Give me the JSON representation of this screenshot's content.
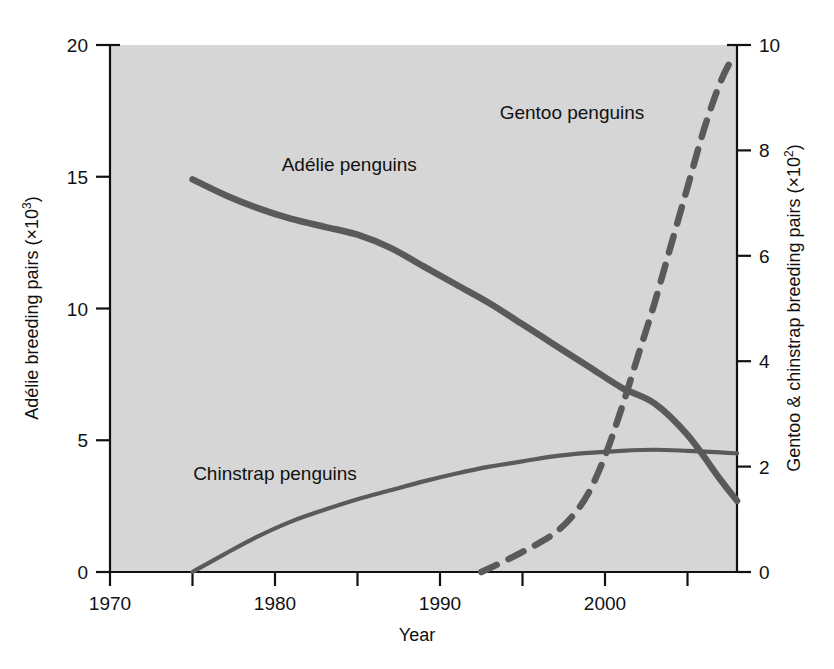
{
  "figure": {
    "background_color": "#ffffff",
    "plot_background_color": "#d6d6d6",
    "line_color": "#5a5a5a",
    "axis_color": "#111111"
  },
  "chart_data": {
    "type": "line",
    "title": "",
    "subtitle": "",
    "xlabel": "Year",
    "ylabel": "Adélie breeding pairs (×10³)",
    "y2label": "Gentoo & chinstrap breeding pairs (×10²)",
    "xlim": [
      1970,
      2008
    ],
    "ylim": [
      0,
      20
    ],
    "y2lim": [
      0,
      10
    ],
    "grid": false,
    "legend_position": "inline-annotations",
    "xticks": [
      1970,
      1975,
      1980,
      1985,
      1990,
      1995,
      2000,
      2005
    ],
    "xtick_labels": [
      "1970",
      "",
      "1980",
      "",
      "1990",
      "",
      "2000",
      ""
    ],
    "xtick_labels_shown": [
      "1970",
      "1980",
      "1990",
      "2000"
    ],
    "yticks": [
      0,
      5,
      10,
      15,
      20
    ],
    "ytick_labels": [
      "0",
      "5",
      "10",
      "15",
      "20"
    ],
    "y2ticks": [
      0,
      2,
      4,
      6,
      8,
      10
    ],
    "y2tick_labels": [
      "0",
      "2",
      "4",
      "6",
      "8",
      "10"
    ],
    "annotations": [
      {
        "text": "Adélie penguins",
        "x": 1984.5,
        "y": 15.2,
        "axis": "left"
      },
      {
        "text": "Gentoo penguins",
        "x": 1998.0,
        "y": 8.6,
        "axis": "right"
      },
      {
        "text": "Chinstrap penguins",
        "x": 1980.0,
        "y": 1.75,
        "axis": "right"
      }
    ],
    "series": [
      {
        "name": "Adélie penguins",
        "axis": "left",
        "style": "solid",
        "units": "breeding pairs (×10³)",
        "x": [
          1975,
          1977,
          1979,
          1981,
          1983,
          1985,
          1987,
          1989,
          1991,
          1993,
          1995,
          1997,
          1999,
          2001,
          2003,
          2005,
          2007,
          2008
        ],
        "values": [
          14.9,
          14.3,
          13.8,
          13.4,
          13.1,
          12.8,
          12.3,
          11.6,
          10.9,
          10.2,
          9.4,
          8.6,
          7.8,
          7.0,
          6.4,
          5.2,
          3.5,
          2.7
        ]
      },
      {
        "name": "Chinstrap penguins",
        "axis": "right",
        "style": "solid",
        "units": "breeding pairs (×10²)",
        "x": [
          1975,
          1977,
          1979,
          1981,
          1983,
          1985,
          1987,
          1989,
          1991,
          1993,
          1995,
          1997,
          1999,
          2001,
          2003,
          2005,
          2007,
          2008
        ],
        "values": [
          0.0,
          0.35,
          0.68,
          0.96,
          1.18,
          1.38,
          1.55,
          1.72,
          1.87,
          2.0,
          2.1,
          2.2,
          2.26,
          2.3,
          2.32,
          2.3,
          2.27,
          2.25
        ]
      },
      {
        "name": "Gentoo penguins",
        "axis": "right",
        "style": "dashed",
        "units": "breeding pairs (×10²)",
        "x": [
          1992.5,
          1994,
          1995,
          1996,
          1997,
          1998,
          1999,
          2000,
          2001,
          2002,
          2003,
          2004,
          2005,
          2006,
          2007,
          2007.8
        ],
        "values": [
          0.0,
          0.22,
          0.38,
          0.55,
          0.75,
          1.05,
          1.5,
          2.2,
          3.1,
          4.1,
          5.1,
          6.2,
          7.3,
          8.4,
          9.3,
          9.8
        ]
      }
    ]
  }
}
